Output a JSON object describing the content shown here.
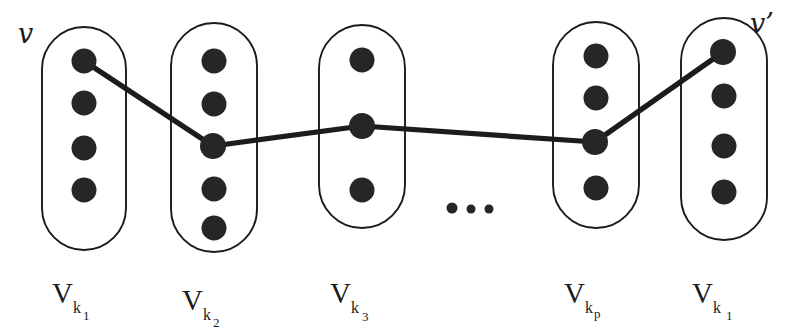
{
  "figure": {
    "name": "path-through-partition-classes-diagram",
    "background_color": "#ffffff",
    "ink_color": "#1a1a1a",
    "dot_color": "#262626",
    "endpoint_labels": {
      "start": "v",
      "end": "v’"
    },
    "ellipsis": {
      "glyph": "…",
      "meaning": "continuation-of-classes"
    },
    "classes": [
      {
        "id": "class-1",
        "label_main": "V",
        "label_sub": "k",
        "label_subsub": "1",
        "label_full": "V k 1",
        "dot_count": 4,
        "cx": 84,
        "rx": 42,
        "top": 27,
        "bottom": 250,
        "dots_y": [
          61,
          103,
          148,
          190
        ],
        "label_x": 52,
        "label_y": 303
      },
      {
        "id": "class-2",
        "label_main": "V",
        "label_sub": "k",
        "label_subsub": "2",
        "label_full": "V k 2",
        "dot_count": 5,
        "cx": 214,
        "rx": 43,
        "top": 23,
        "bottom": 252,
        "dots_y": [
          61,
          104,
          146,
          189,
          228
        ],
        "label_x": 182,
        "label_y": 310
      },
      {
        "id": "class-3",
        "label_main": "V",
        "label_sub": "k",
        "label_subsub": "3",
        "label_full": "V k 3",
        "dot_count": 3,
        "cx": 362,
        "rx": 43,
        "top": 25,
        "bottom": 228,
        "dots_y": [
          60,
          126,
          190
        ],
        "label_x": 330,
        "label_y": 303
      },
      {
        "id": "class-4",
        "label_main": "V",
        "label_sub": "k",
        "label_subsub": "p",
        "label_full": "V k p",
        "dot_count": 4,
        "cx": 596,
        "rx": 43,
        "top": 22,
        "bottom": 228,
        "dots_y": [
          56,
          98,
          142,
          188
        ],
        "label_x": 564,
        "label_y": 303
      },
      {
        "id": "class-5",
        "label_main": "V",
        "label_sub": "k",
        "label_subsub": "1",
        "label_full": "V k 1",
        "dot_count": 4,
        "cx": 724,
        "rx": 43,
        "top": 18,
        "bottom": 240,
        "dots_y": [
          52,
          96,
          146,
          192
        ],
        "label_x": 692,
        "label_y": 303
      }
    ],
    "path_vertices": [
      {
        "class": "class-1",
        "x": 84,
        "y": 61,
        "role": "start-vertex-v"
      },
      {
        "class": "class-2",
        "x": 213,
        "y": 146,
        "role": "intermediate-vertex"
      },
      {
        "class": "class-3",
        "x": 362,
        "y": 126,
        "role": "intermediate-vertex"
      },
      {
        "class": "class-4",
        "x": 595,
        "y": 142,
        "role": "intermediate-vertex"
      },
      {
        "class": "class-5",
        "x": 723,
        "y": 52,
        "role": "end-vertex-v-prime"
      }
    ],
    "ellipsis_dots": [
      {
        "cx": 452,
        "cy": 208,
        "r": 5.5
      },
      {
        "cx": 471,
        "cy": 209,
        "r": 4.5
      },
      {
        "cx": 489,
        "cy": 209,
        "r": 4.5
      }
    ],
    "dot_radius": 12.5
  }
}
